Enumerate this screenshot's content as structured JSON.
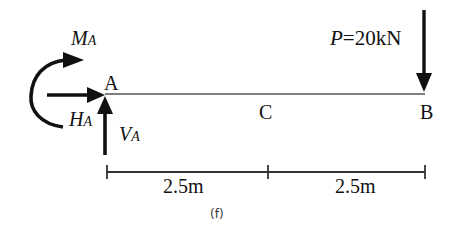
{
  "figure": {
    "caption": "(f)"
  },
  "beam": {
    "points": [
      {
        "id": "A",
        "label": "A"
      },
      {
        "id": "C",
        "label": "C"
      },
      {
        "id": "B",
        "label": "B"
      }
    ]
  },
  "loads": {
    "point_load": {
      "symbol": "P",
      "equals": "=",
      "value": "20kN",
      "full_label": "P=20kN",
      "location": "B",
      "direction": "down"
    }
  },
  "reactions": {
    "moment": {
      "symbol": "M",
      "subscript": "A",
      "direction": "clockwise"
    },
    "horizontal": {
      "symbol": "H",
      "subscript": "A",
      "direction": "right"
    },
    "vertical": {
      "symbol": "V",
      "subscript": "A",
      "direction": "up"
    }
  },
  "dimensions": {
    "segments": [
      {
        "from": "A",
        "to": "C",
        "label": "2.5m"
      },
      {
        "from": "C",
        "to": "B",
        "label": "2.5m"
      }
    ]
  },
  "colors": {
    "ink": "#111111",
    "beam": "#555555",
    "background": "#ffffff"
  }
}
